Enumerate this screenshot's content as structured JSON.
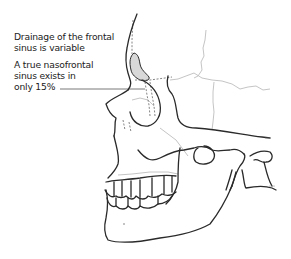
{
  "diagram": {
    "annotations": [
      {
        "id": "drainage-note",
        "lines": [
          "Drainage of the frontal",
          "sinus is variable"
        ]
      },
      {
        "id": "nasofrontal-note",
        "lines": [
          "A true nasofrontal",
          "sinus exists in",
          "only 15%"
        ]
      }
    ],
    "colors": {
      "outline": "#2a2a2a",
      "suture": "#b8b8b8",
      "sinus_fill": "#d8d8d8",
      "text": "#222222",
      "background": "#ffffff"
    }
  }
}
